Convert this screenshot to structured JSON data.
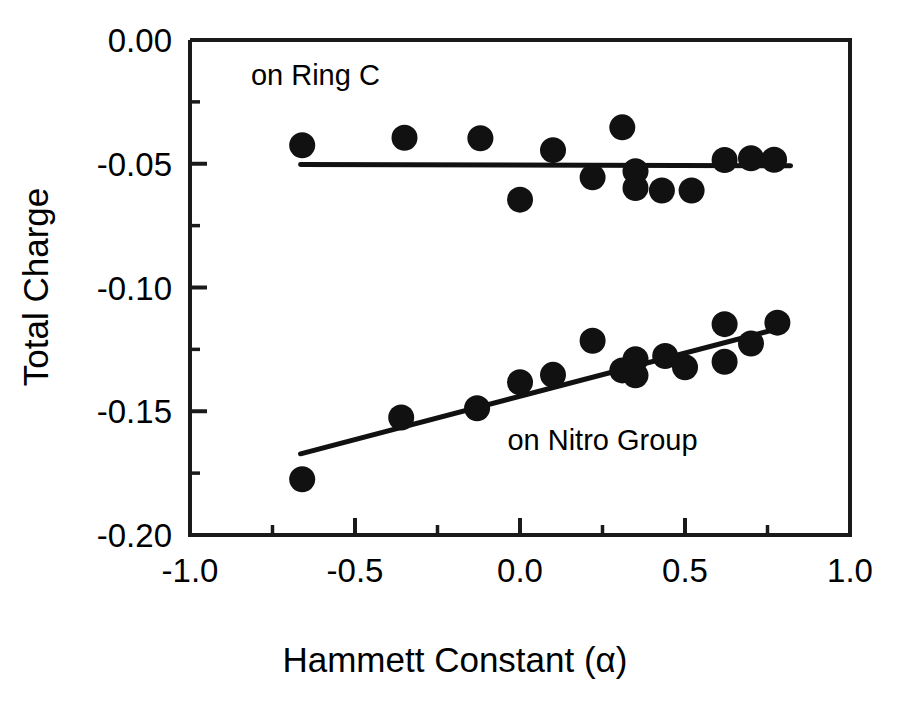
{
  "chart_data": {
    "type": "scatter",
    "title": "",
    "xlabel": "Hammett Constant (α)",
    "ylabel": "Total Charge",
    "xlim": [
      -1.0,
      1.0
    ],
    "ylim": [
      -0.2,
      0.0
    ],
    "xticks": [
      -1.0,
      -0.5,
      0.0,
      0.5,
      1.0
    ],
    "xticklabels": [
      "-1.0",
      "-0.5",
      "0.0",
      "0.5",
      "1.0"
    ],
    "xminorticks": [
      -0.75,
      -0.25,
      0.25,
      0.75
    ],
    "yticks": [
      0.0,
      -0.05,
      -0.1,
      -0.15,
      -0.2
    ],
    "yticklabels": [
      "0.00",
      "-0.05",
      "-0.10",
      "-0.15",
      "-0.20"
    ],
    "yminorticks": [
      -0.025,
      -0.075,
      -0.125,
      -0.175
    ],
    "grid": false,
    "legend": "inline-annotations",
    "marker": "filled-circle",
    "marker_color": "#111111",
    "series": [
      {
        "name": "on Ring C",
        "annotation": "on Ring C",
        "annotation_x": -0.62,
        "annotation_y": -0.018,
        "points": [
          {
            "x": -0.66,
            "y": -0.0425
          },
          {
            "x": -0.35,
            "y": -0.0395
          },
          {
            "x": -0.12,
            "y": -0.0397
          },
          {
            "x": 0.0,
            "y": -0.0645
          },
          {
            "x": 0.1,
            "y": -0.0445
          },
          {
            "x": 0.22,
            "y": -0.0555
          },
          {
            "x": 0.31,
            "y": -0.0353
          },
          {
            "x": 0.35,
            "y": -0.053
          },
          {
            "x": 0.35,
            "y": -0.0598
          },
          {
            "x": 0.43,
            "y": -0.0608
          },
          {
            "x": 0.52,
            "y": -0.0608
          },
          {
            "x": 0.62,
            "y": -0.0485
          },
          {
            "x": 0.7,
            "y": -0.0478
          },
          {
            "x": 0.77,
            "y": -0.0484
          }
        ],
        "fit_line": {
          "x1": -0.665,
          "y1": -0.0503,
          "x2": 0.82,
          "y2": -0.0508
        }
      },
      {
        "name": "on Nitro Group",
        "annotation": "on Nitro Group",
        "annotation_x": 0.25,
        "annotation_y": -0.1655,
        "points": [
          {
            "x": -0.66,
            "y": -0.1775
          },
          {
            "x": -0.36,
            "y": -0.1525
          },
          {
            "x": -0.13,
            "y": -0.1488
          },
          {
            "x": 0.0,
            "y": -0.1383
          },
          {
            "x": 0.1,
            "y": -0.1353
          },
          {
            "x": 0.22,
            "y": -0.1215
          },
          {
            "x": 0.31,
            "y": -0.1335
          },
          {
            "x": 0.35,
            "y": -0.1355
          },
          {
            "x": 0.35,
            "y": -0.129
          },
          {
            "x": 0.44,
            "y": -0.1277
          },
          {
            "x": 0.5,
            "y": -0.1322
          },
          {
            "x": 0.62,
            "y": -0.1148
          },
          {
            "x": 0.62,
            "y": -0.13
          },
          {
            "x": 0.7,
            "y": -0.1226
          },
          {
            "x": 0.78,
            "y": -0.1142
          }
        ],
        "fit_line": {
          "x1": -0.665,
          "y1": -0.1672,
          "x2": 0.8,
          "y2": -0.116
        }
      }
    ]
  }
}
